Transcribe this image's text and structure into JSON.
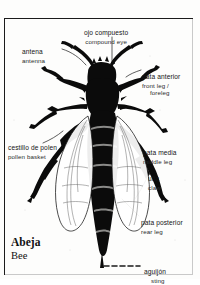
{
  "plate": {
    "title_es": "Abeja",
    "title_en": "Bee",
    "subject": "bee-anatomy-illustration"
  },
  "labels": [
    {
      "id": "antena",
      "es": "antena",
      "en": "antenna",
      "side": "left"
    },
    {
      "id": "ojo-compuesto",
      "es": "ojo compuesto",
      "en": "compound eye",
      "side": "top"
    },
    {
      "id": "pata-anterior",
      "es": "pata anterior",
      "en": "front leg /",
      "en2": "foreleg",
      "side": "right"
    },
    {
      "id": "cestillo-de-polen",
      "es": "cestillo de polen",
      "en": "pollen basket",
      "side": "left"
    },
    {
      "id": "pata-media",
      "es": "pata media",
      "en": "middle leg",
      "side": "right"
    },
    {
      "id": "una",
      "es": "uña",
      "en": "claw",
      "side": "right"
    },
    {
      "id": "pata-posterior",
      "es": "pata posterior",
      "en": "rear leg",
      "side": "right"
    },
    {
      "id": "aguijon",
      "es": "aguijón",
      "en": "sting",
      "side": "bottom"
    }
  ],
  "colors": {
    "ink": "#141414",
    "paper": "#fdfdfc",
    "frame": "#1b1b1b"
  }
}
